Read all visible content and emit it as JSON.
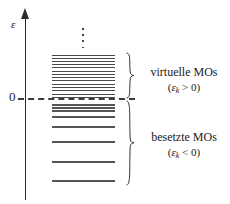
{
  "figure": {
    "type": "molecular-orbital-energy-level-diagram",
    "background_color": "#ffffff",
    "line_color": "#4a4a4a",
    "axis_color": "#2b2b2b"
  },
  "axis": {
    "label": "ε",
    "zero_tick_label": "0",
    "direction": "up"
  },
  "zero_line": {
    "style": "dashed",
    "value": 0
  },
  "ellipsis": {
    "glyph": "⋮",
    "dot_count": 4,
    "meaning": "continuation of virtual orbital manifold"
  },
  "groups": [
    {
      "key": "virtual",
      "title": "virtuelle MOs",
      "condition_open": "(",
      "condition_var": "ε",
      "condition_sub": "k",
      "condition_rel": " > 0)",
      "condition_full": "(εₖ > 0)",
      "brace_name": "brace-virtual"
    },
    {
      "key": "occupied",
      "title": "besetzte MOs",
      "condition_open": "(",
      "condition_var": "ε",
      "condition_sub": "k",
      "condition_rel": " < 0)",
      "condition_full": "(εₖ < 0)",
      "brace_name": "brace-occupied"
    }
  ],
  "chart_data": {
    "type": "level-diagram",
    "title": "",
    "xlabel": "",
    "ylabel": "ε",
    "zero_reference": 0,
    "virtual_levels_y": [
      55,
      58,
      61,
      64,
      67,
      71,
      74,
      77,
      80,
      84,
      87,
      90,
      94,
      97
    ],
    "occupied_levels_y": [
      104,
      107,
      110,
      116,
      126,
      141,
      161,
      180
    ],
    "virtual_count": 14,
    "occupied_count": 8,
    "level_x_start": 52,
    "level_x_end": 115
  }
}
